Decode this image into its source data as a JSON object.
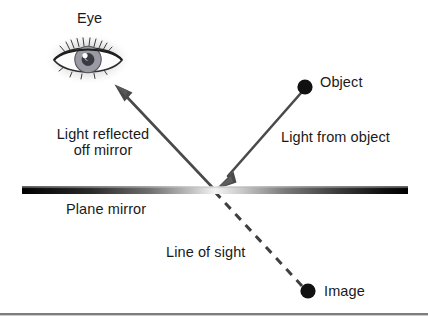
{
  "figure": {
    "background_color": "#ffffff",
    "width": 428,
    "height": 324
  },
  "labels": {
    "eye": "Eye",
    "object": "Object",
    "light_from_object": "Light from object",
    "light_reflected_line1": "Light reflected",
    "light_reflected_line2": "off mirror",
    "plane_mirror": "Plane mirror",
    "line_of_sight": "Line of sight",
    "image": "Image"
  },
  "colors": {
    "text": "#1a1a1a",
    "ray": "#4a4a4a",
    "dot": "#111111",
    "mirror_dark": "#000000",
    "mirror_light": "#f2f2f2",
    "baseline_rule": "#808080",
    "iris": "#9a9aa2",
    "pupil": "#3a3a42",
    "highlight": "#ffffff"
  },
  "geometry": {
    "mirror": {
      "x1": 22,
      "x2": 408,
      "y": 190,
      "thickness": 7
    },
    "vertex": {
      "x": 215,
      "y": 190
    },
    "object_dot": {
      "x": 305,
      "y": 87,
      "r": 7.5
    },
    "image_dot": {
      "x": 308,
      "y": 291,
      "r": 7.5
    },
    "eye_arrow_tip": {
      "x": 116,
      "y": 86
    },
    "baseline_rule_y": 314
  },
  "elements": {
    "incident_ray_name": "Light from object",
    "reflected_ray_name": "Light reflected off mirror",
    "virtual_ray_name": "Line of sight",
    "mirror_name": "Plane mirror"
  }
}
